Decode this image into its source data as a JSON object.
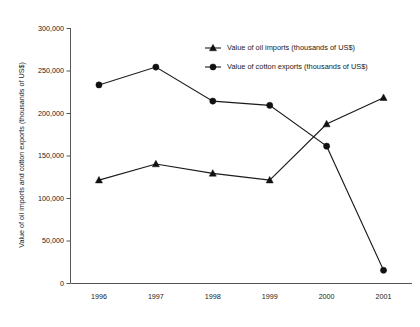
{
  "chart_data": {
    "type": "line",
    "title": "",
    "xlabel": "",
    "ylabel": "Value of oil imports and cotton exports (thousands of US$)",
    "categories": [
      "1996",
      "1997",
      "1998",
      "1999",
      "2000",
      "2001"
    ],
    "ylim": [
      0,
      300000
    ],
    "ytick_values": [
      0,
      50000,
      100000,
      150000,
      200000,
      250000,
      300000
    ],
    "ytick_labels": [
      "0",
      "50,000",
      "100,000",
      "150,000",
      "200,000",
      "250,000",
      "300,000"
    ],
    "grid": false,
    "legend_position": "top-right-inside",
    "series": [
      {
        "name": "Value of oil imports (thousands of US$)",
        "marker": "triangle",
        "color": "#111111",
        "values": [
          121000,
          140000,
          129000,
          121000,
          187000,
          218000
        ]
      },
      {
        "name": "Value of cotton exports (thousands of US$)",
        "marker": "circle",
        "color": "#111111",
        "values": [
          233000,
          254000,
          214000,
          209000,
          161000,
          15000
        ]
      }
    ]
  },
  "legend": {
    "items": [
      {
        "label": "Value of oil imports (thousands of US$)",
        "marker": "triangle"
      },
      {
        "label": "Value of cotton exports (thousands of US$)",
        "marker": "circle"
      }
    ]
  }
}
